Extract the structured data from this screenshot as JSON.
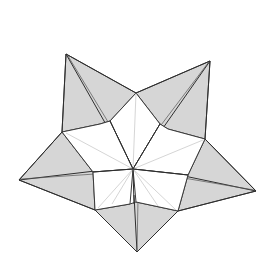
{
  "diagram": {
    "colors": {
      "background": "#ffffff",
      "flap_fill": "#d6d6d6",
      "outline": "#3a3a3a",
      "crease": "#b9b9b9"
    },
    "points": 5,
    "center": [
      133,
      169
    ]
  }
}
